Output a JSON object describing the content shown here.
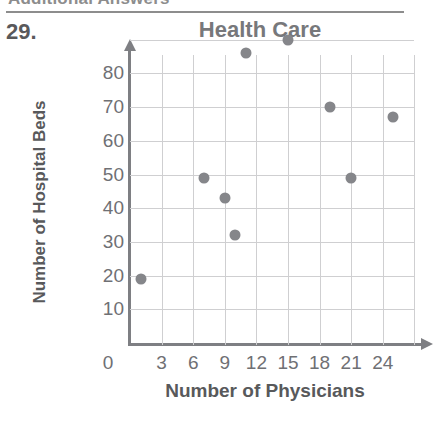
{
  "page": {
    "running_head": "Additional Answers",
    "problem_number": "29."
  },
  "chart_data": {
    "type": "scatter",
    "title": "Health Care",
    "xlabel": "Number of Physicians",
    "ylabel": "Number of Hospital Beds",
    "xlim": [
      0,
      27
    ],
    "ylim": [
      0,
      90
    ],
    "grid": true,
    "legend": "none",
    "xticks": [
      "0",
      "3",
      "6",
      "9",
      "12",
      "15",
      "18",
      "21",
      "24"
    ],
    "xtick_values": [
      0,
      3,
      6,
      9,
      12,
      15,
      18,
      21,
      24
    ],
    "yticks": [
      "10",
      "20",
      "30",
      "40",
      "50",
      "60",
      "70",
      "80"
    ],
    "ytick_values": [
      10,
      20,
      30,
      40,
      50,
      60,
      70,
      80
    ],
    "points": [
      {
        "x": 1,
        "y": 19
      },
      {
        "x": 7,
        "y": 49
      },
      {
        "x": 9,
        "y": 43
      },
      {
        "x": 10,
        "y": 32
      },
      {
        "x": 11,
        "y": 86
      },
      {
        "x": 15,
        "y": 90
      },
      {
        "x": 19,
        "y": 70
      },
      {
        "x": 21,
        "y": 49
      },
      {
        "x": 25,
        "y": 67
      }
    ],
    "colors": {
      "marker": "#85868a",
      "grid": "#cfcfd1",
      "axis": "#7e7f83",
      "title": "#77787b",
      "tick_label": "#6f7074",
      "axis_title": "#58595b"
    }
  }
}
